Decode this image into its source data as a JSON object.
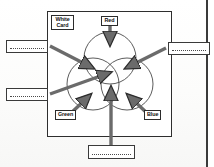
{
  "figure": {
    "card": {
      "label": "White\nCard",
      "name": "white-card-panel"
    },
    "sources": [
      {
        "id": "red",
        "label": "Red",
        "color": "#555555"
      },
      {
        "id": "green",
        "label": "Green",
        "color": "#555555"
      },
      {
        "id": "blue",
        "label": "Blue",
        "color": "#555555"
      }
    ],
    "answer_boxes": [
      {
        "id": "left-top",
        "value": "",
        "placeholder": ""
      },
      {
        "id": "left-bot",
        "value": "",
        "placeholder": ""
      },
      {
        "id": "right-top",
        "value": "",
        "placeholder": ""
      },
      {
        "id": "bottom",
        "value": "",
        "placeholder": ""
      }
    ],
    "colors": {
      "ink": "#2e2e2e",
      "arrow": "#6b6b6b",
      "arrow_outline": "#2b2b2b",
      "paper": "#ffffff",
      "scan_edge": "#3a3a3a"
    }
  }
}
